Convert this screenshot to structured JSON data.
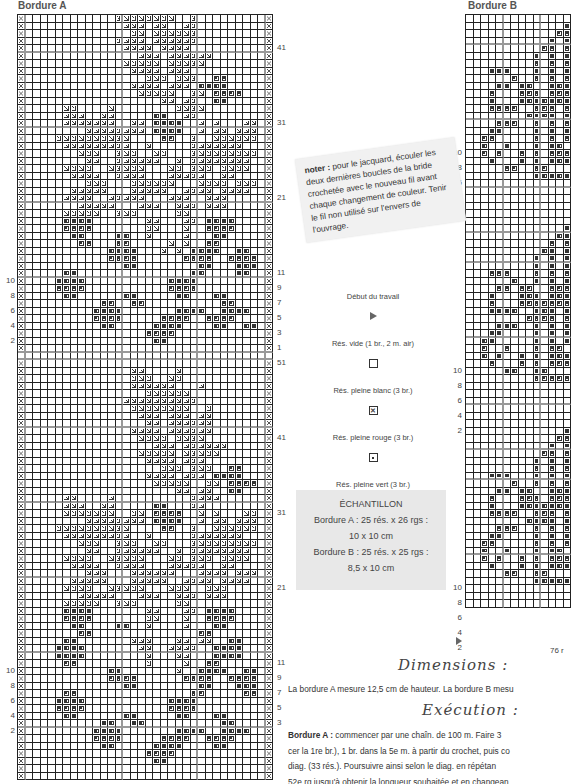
{
  "bordure_a": {
    "title": "Bordure A",
    "cols": 34,
    "cell_px": 7.5,
    "right_labels": [
      {
        "text": "41",
        "row": 4
      },
      {
        "text": "31",
        "row": 14
      },
      {
        "text": "21",
        "row": 24
      },
      {
        "text": "11",
        "row": 34
      },
      {
        "text": "9",
        "row": 36
      },
      {
        "text": "7",
        "row": 38
      },
      {
        "text": "5",
        "row": 40
      },
      {
        "text": "3",
        "row": 42
      },
      {
        "text": "1",
        "row": 44
      },
      {
        "text": "51",
        "row": 46
      },
      {
        "text": "41",
        "row": 56
      },
      {
        "text": "31",
        "row": 66
      },
      {
        "text": "21",
        "row": 76
      },
      {
        "text": "11",
        "row": 86
      },
      {
        "text": "9",
        "row": 88
      },
      {
        "text": "7",
        "row": 90
      },
      {
        "text": "5",
        "row": 92
      },
      {
        "text": "3",
        "row": 94
      }
    ],
    "left_labels": [
      {
        "text": "10",
        "row": 35
      },
      {
        "text": "8",
        "row": 37
      },
      {
        "text": "6",
        "row": 39
      },
      {
        "text": "4",
        "row": 41
      },
      {
        "text": "2",
        "row": 43
      },
      {
        "text": "10",
        "row": 87
      },
      {
        "text": "8",
        "row": 89
      },
      {
        "text": "6",
        "row": 91
      },
      {
        "text": "4",
        "row": 93
      },
      {
        "text": "2",
        "row": 95
      }
    ],
    "rows": [
      "x............gggggggg..g.........x",
      "x.............ggg.gg..gg.........x",
      "x..............gg.gggggg.........x",
      "x............gggg.gggggg.........x",
      "x.............gggg.gggg..........x",
      "x...............ggg.gggggg.......x",
      "x.............ggggg.ggggg........x",
      "x..............gggg.ggg..........x",
      "x................ggg.ggg..rr.....x",
      "x..............gggg.ggg.rrrr.....x",
      "x...............ggggg..gg.rrrr...x",
      "x..................gg.gg..rr.....x",
      "x.....gg....g........gggg........x",
      "x.....ggg..gg.....rr..gg.........x",
      "x.....ggggggg..gg.rrrr..g.g...gg.x",
      "x........gggggggg.rrrr..g.gg.ggg.x",
      "x....gggggggggg....rr..g..gggggg.x",
      "x.....ggggggggg..g.....ggggggg...x",
      "x.......ggg..ggg..gg...ggggggggg.x",
      "x........gg..gggggg..g.gggggggg..x",
      "x.....gggg..ggggg...gg.ggg.gggg..x",
      "x......gggg..gggg...ggggg..gg....x",
      "x........ggg...gggggg...gggg.ggg.x",
      "x......ggggg...ggggg..gggg.gggg..x",
      "x.....gggg..ggggg...ggg..ggg.....x",
      "x.......ggggg...ggg..ggg.ggg.....x",
      "x.....ggggg..ggg.....gg..........x",
      "x.....rrrr.......gg...gg.rrrr....x",
      "x.....rrrr.......gg...g..rrrr....x",
      "x......rr....rr..g....g...rr.....x",
      "x.......rr...rr.....g.g..rr......x",
      "x...........rrrr...g.g.rrrr..rr..x",
      "x...........rrrr......rrrr..rrrr.x",
      "x.............rr........rr...rrr.x",
      "x.....rr...............rr....rr..x",
      "x....rrrr...........rrrr.........x",
      "x....rrrr...........rrrr.........x",
      "x.....rr......rr.....rr...rr.....x",
      "x..........rr..rr..........rr....x",
      "x.........rrrr.......rrrr..rrrr..x",
      "x.........rrrr.....rrrr..rrrr....x",
      "x..........rr.....rrrr....rr..rr.x",
      "x................rrrr............x",
      "x.................rr.............x",
      "x................................x",
      "x................................x",
      "x................................x",
      "x..............gg....g...........x",
      "x..............ggg..gg...........x",
      "x..............gggggg...g........x",
      "x................gggggg..........x",
      "x.............gggggggggg.........x",
      "x..............gggggggg..g.......x",
      "x...............ggg.ggg.gg.......x",
      "x................gg.gggggg.......x",
      "x..............gggg.gggggg.......x",
      "x...............gggg.gggg........x",
      "x.................ggg.gggggg.....x",
      "x...............ggggg.ggggg......x",
      "x................gggg.ggg........x",
      "x..................ggg.ggg..rr...x",
      "x................gggg.ggg.rrrr...x",
      "x.................ggggg..gg.rrrr.x",
      "x....................gg.gg..rr...x",
      "x.....gg....g..........gggg......x",
      "x.....ggg..gg.....rr...gg........x",
      "x.....ggggggg..gg.rrrr..g.g...gg.x",
      "x........gggggggg.rrrr..g.gg.ggg.x",
      "x....gggggggggg....rr..g..gggggg.x",
      "x.....ggggggggg..g.....ggggggg...x",
      "x.......ggg..ggg..gg...ggggggggg.x",
      "x........gg..gggggg..g.gggggggg..x",
      "x.....gggg..ggggg...gg.ggg.gggg..x",
      "x......gggg..gggg...ggggg..gg....x",
      "x........ggg...gggggg...gggg.ggg.x",
      "x......ggggg...ggggg..gggg.gggg..x",
      "x.....gggg..ggggg...ggg..ggg.....x",
      "x.......ggggg...ggg..ggg.ggg.....x",
      "x.....ggggg..ggg.....gg..........x",
      "x.....rrrr.......gg...gg.rrrr....x",
      "x.....rrrr.......gg...g..rrrr....x",
      "x......rr....rr..g....g...rr.....x",
      "x.......rr..............rr.......x",
      "x.....rr.......ggg...gg.gg..rr...x",
      "x....rrrr.......gg..gggg..rrrr...x",
      "x....rrrr........g...gg...rrrr...x",
      "x.....rr.........g....g..rr......x",
      "x...........rr.......g..rrrr..rr.x",
      "x...........rrrr......rrrr..rrrr.x",
      "x.............rr........rr...rrr.x",
      "x.....rr...............rr.....rr.x",
      "x....rrrr...........rrrr.........x",
      "x....rrrr...........rrrr.........x",
      "x.....rr......rr.....rr...rr.....x",
      "x..........rr..rr..........rr....x",
      "x.........rrrr.......rrrr..rrrr..x",
      "x.........rrrr.....rrrr..rrrr....x",
      "x..........rr.....rrrr....rr.....x",
      "x................rrrr............x",
      "x.................rr.............x",
      "x................................x",
      "x................................x"
    ]
  },
  "bordure_b": {
    "title": "Bordure B",
    "cols": 14,
    "cell_px": 7.5,
    "bottom_label": "76 r",
    "left_labels": [
      {
        "text": "10",
        "row": 18
      },
      {
        "text": "8",
        "row": 20
      },
      {
        "text": "6",
        "row": 22
      },
      {
        "text": "4",
        "row": 24
      },
      {
        "text": "2",
        "row": 26
      },
      {
        "text": "10",
        "row": 47
      },
      {
        "text": "8",
        "row": 49
      },
      {
        "text": "6",
        "row": 51
      },
      {
        "text": "4",
        "row": 53
      },
      {
        "text": "2",
        "row": 55
      },
      {
        "text": "10",
        "row": 76
      },
      {
        "text": "8",
        "row": 78
      },
      {
        "text": "6",
        "row": 80
      },
      {
        "text": "4",
        "row": 82
      },
      {
        "text": "2",
        "row": 84
      }
    ],
    "rows": [
      "..............",
      ".............r",
      "............rr",
      "...........r.r",
      "..........rr.r",
      ".........r.r.r",
      ".........r.r.r",
      "...rrr...r.r.r",
      "......r..r.r.r",
      "....rr.rr..rrr",
      "...r...rrr.rrr",
      "...r...rrrrrrr",
      "...rrrr..rrr.r",
      "........rrrr.r",
      "....rrr..r.r.r",
      "...rr....r.r.r",
      "..rr.....r.r.r",
      "..r..r...r.rr.",
      "..r.r..r.r.rrr",
      "...r...r.r.rrr",
      ".....rr..rr...",
      ".........rrrrr",
      "..............",
      "..............",
      "..............",
      "..............",
      "..............",
      "..............",
      ".............r",
      "............rr",
      "...........r.r",
      "..........rr.r",
      ".........r.r.r",
      ".........r.r.r",
      "...rrr...r.r.r",
      "......r..r.r.r",
      "....rr.rr..rrr",
      "...r...rrr.rrr",
      "...r...rrrrrrr",
      "...rrrr..rrr.r",
      "........rrrr.r",
      "....rrr..r.r.r",
      "...rr....r.r.r",
      "..rr.....r.r.r",
      "..r..r...r.rr.",
      "..r.r..r.r.rrr",
      "...r...r.r.rrr",
      ".....rr..rr...",
      ".........rrrrr",
      "..............",
      "..............",
      "..............",
      "..............",
      "..............",
      "..............",
      ".............r",
      "............rr",
      "...........r.r",
      "..........rr.r",
      ".........r.r.r",
      ".........r.r.r",
      "...rrr...r.r.r",
      "......r..r.r.r",
      "....rr.rr..rrr",
      "...r...rrr.rrr",
      "...r...rrrrrrr",
      "...rrrr..rrr.r",
      "........rrrr.r",
      "....rrr..r.r.r",
      "...rr....r.r.r",
      "..rr.....r.r.r",
      "..r..r...r.rr.",
      "..r.r..r.r.rrr",
      "...r...r.r.rrr",
      ".....rr..rr...",
      ".........rrrrr",
      "..............",
      "..............",
      ".............."
    ]
  },
  "note": {
    "bold": "noter :",
    "text": " pour le jacquard, écouler les deux dernières boucles de la bride crochetée avec le nouveau fil avant chaque changement de couleur. Tenir le fil non utilisé sur l'envers de l'ouvrage."
  },
  "legend": {
    "items": [
      {
        "label": "Début du travail",
        "symbol": "start",
        "icon": "play-triangle-icon"
      },
      {
        "label": "Rés. vide (1 br., 2 m. air)",
        "symbol": "empty",
        "icon": "empty-square-icon"
      },
      {
        "label": "Rés. pleine blanc (3 br.)",
        "symbol": "x",
        "icon": "cross-square-icon"
      },
      {
        "label": "Rés. pleine rouge (3 br.)",
        "symbol": "r",
        "icon": "dot-square-icon"
      },
      {
        "label": "Rés. pleine vert (3 br.)",
        "symbol": "g",
        "icon": "triangle-square-icon"
      }
    ]
  },
  "sample": {
    "title": "ÉCHANTILLON",
    "lines": [
      "Bordure A : 25 rés. x 26 rgs :",
      "10 x 10 cm",
      "Bordure B : 25 rés. x 25 rgs :",
      "8,5 x 10 cm"
    ]
  },
  "dimensions": {
    "heading": "Dimensions :",
    "text": "La bordure A mesure 12,5 cm de hauteur. La bordure B mesu"
  },
  "execution": {
    "heading": "Exécution :",
    "bold": "Bordure A :",
    "lines": [
      " commencer par une chaîn. de 100 m. Faire 3",
      "cer la 1re br.), 1 br. dans la 5e m. à partir du crochet, puis co",
      "diag. (33 rés.). Poursuivre ainsi selon le diag. en répétan",
      "52e rg jusqu'à obtenir la longueur souhaitée et en changean"
    ]
  },
  "colors": {
    "grid_line": "#222222",
    "grid_thick": "#999999",
    "note_bg": "#f1f1f1",
    "sample_bg": "#e8e8e8",
    "text": "#333333"
  }
}
